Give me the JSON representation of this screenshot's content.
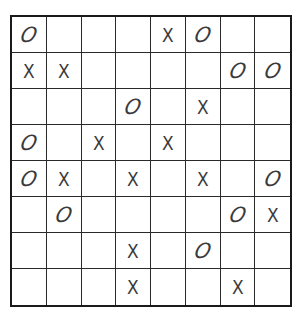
{
  "puzzle": {
    "rows": 8,
    "cols": 8,
    "symbols": {
      "x": "X",
      "o": "O",
      "empty": ""
    },
    "grid": [
      [
        "O",
        "",
        "",
        "",
        "X",
        "O",
        "",
        ""
      ],
      [
        "X",
        "X",
        "",
        "",
        "",
        "",
        "O",
        "O"
      ],
      [
        "",
        "",
        "",
        "O",
        "",
        "X",
        "",
        ""
      ],
      [
        "O",
        "",
        "X",
        "",
        "X",
        "",
        "",
        ""
      ],
      [
        "O",
        "X",
        "",
        "X",
        "",
        "X",
        "",
        "O"
      ],
      [
        "",
        "O",
        "",
        "",
        "",
        "",
        "O",
        "X"
      ],
      [
        "",
        "",
        "",
        "X",
        "",
        "O",
        "",
        ""
      ],
      [
        "",
        "",
        "",
        "X",
        "",
        "",
        "X",
        ""
      ]
    ]
  },
  "colors": {
    "border": "#1a1a1a",
    "gridline": "#2a2a2a",
    "mark": "#3a3a3a",
    "background": "#ffffff"
  }
}
